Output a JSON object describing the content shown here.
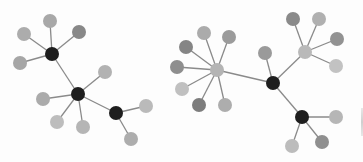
{
  "diagram": {
    "title": "",
    "type": "network-graph",
    "colors": {
      "background": "#fdfdfd",
      "edge": "#8a8a8a",
      "hub_dark": "#1e1e1e",
      "hub_light": "#b4b4b4",
      "leaf_light": "#b9b9b9",
      "leaf_mid": "#a2a2a2",
      "leaf_dark": "#838383"
    },
    "graphs": [
      {
        "id": "left-graph",
        "nodes": [
          {
            "id": "A",
            "role": "hub",
            "x": 52,
            "y": 54,
            "r": 7,
            "color": "#1e1e1e"
          },
          {
            "id": "A1",
            "role": "leaf",
            "x": 50,
            "y": 21,
            "r": 7,
            "color": "#a8a8a8"
          },
          {
            "id": "A2",
            "role": "leaf",
            "x": 24,
            "y": 34,
            "r": 7,
            "color": "#acacac"
          },
          {
            "id": "A3",
            "role": "leaf",
            "x": 79,
            "y": 32,
            "r": 7,
            "color": "#888888"
          },
          {
            "id": "A4",
            "role": "leaf",
            "x": 20,
            "y": 63,
            "r": 7,
            "color": "#a6a6a6"
          },
          {
            "id": "B",
            "role": "hub",
            "x": 78,
            "y": 94,
            "r": 7,
            "color": "#1e1e1e"
          },
          {
            "id": "B1",
            "role": "leaf",
            "x": 105,
            "y": 72,
            "r": 7,
            "color": "#b2b2b2"
          },
          {
            "id": "B2",
            "role": "leaf",
            "x": 43,
            "y": 99,
            "r": 7,
            "color": "#ababab"
          },
          {
            "id": "B3",
            "role": "leaf",
            "x": 57,
            "y": 122,
            "r": 7,
            "color": "#bdbdbd"
          },
          {
            "id": "B4",
            "role": "leaf",
            "x": 83,
            "y": 127,
            "r": 7,
            "color": "#b5b5b5"
          },
          {
            "id": "C",
            "role": "hub",
            "x": 116,
            "y": 113,
            "r": 7,
            "color": "#1e1e1e"
          },
          {
            "id": "C1",
            "role": "leaf",
            "x": 146,
            "y": 106,
            "r": 7,
            "color": "#bababa"
          },
          {
            "id": "C2",
            "role": "leaf",
            "x": 131,
            "y": 139,
            "r": 7,
            "color": "#adadad"
          }
        ],
        "edges": [
          [
            "A",
            "A1"
          ],
          [
            "A",
            "A2"
          ],
          [
            "A",
            "A3"
          ],
          [
            "A",
            "A4"
          ],
          [
            "A",
            "B"
          ],
          [
            "B",
            "B1"
          ],
          [
            "B",
            "B2"
          ],
          [
            "B",
            "B3"
          ],
          [
            "B",
            "B4"
          ],
          [
            "B",
            "C"
          ],
          [
            "C",
            "C1"
          ],
          [
            "C",
            "C2"
          ]
        ]
      },
      {
        "id": "right-graph",
        "nodes": [
          {
            "id": "D",
            "role": "hub",
            "x": 217,
            "y": 70,
            "r": 7,
            "color": "#b4b4b4"
          },
          {
            "id": "D1",
            "role": "leaf",
            "x": 204,
            "y": 33,
            "r": 7,
            "color": "#ababab"
          },
          {
            "id": "D2",
            "role": "leaf",
            "x": 229,
            "y": 37,
            "r": 7,
            "color": "#9b9b9b"
          },
          {
            "id": "D3",
            "role": "leaf",
            "x": 186,
            "y": 47,
            "r": 7,
            "color": "#858585"
          },
          {
            "id": "D4",
            "role": "leaf",
            "x": 177,
            "y": 67,
            "r": 7,
            "color": "#8e8e8e"
          },
          {
            "id": "D5",
            "role": "leaf",
            "x": 182,
            "y": 89,
            "r": 7,
            "color": "#c0c0c0"
          },
          {
            "id": "D6",
            "role": "leaf",
            "x": 199,
            "y": 105,
            "r": 7,
            "color": "#7d7d7d"
          },
          {
            "id": "D7",
            "role": "leaf",
            "x": 225,
            "y": 105,
            "r": 7,
            "color": "#adadad"
          },
          {
            "id": "E",
            "role": "hub",
            "x": 273,
            "y": 83,
            "r": 7,
            "color": "#1e1e1e"
          },
          {
            "id": "E1",
            "role": "leaf",
            "x": 265,
            "y": 53,
            "r": 7,
            "color": "#9a9a9a"
          },
          {
            "id": "F",
            "role": "hub",
            "x": 305,
            "y": 52,
            "r": 7,
            "color": "#b9b9b9"
          },
          {
            "id": "F1",
            "role": "leaf",
            "x": 293,
            "y": 19,
            "r": 7,
            "color": "#8a8a8a"
          },
          {
            "id": "F2",
            "role": "leaf",
            "x": 319,
            "y": 19,
            "r": 7,
            "color": "#b0b0b0"
          },
          {
            "id": "F3",
            "role": "leaf",
            "x": 337,
            "y": 39,
            "r": 7,
            "color": "#929292"
          },
          {
            "id": "F4",
            "role": "leaf",
            "x": 336,
            "y": 66,
            "r": 7,
            "color": "#c2c2c2"
          },
          {
            "id": "G",
            "role": "hub",
            "x": 302,
            "y": 117,
            "r": 7,
            "color": "#1e1e1e"
          },
          {
            "id": "G1",
            "role": "leaf",
            "x": 336,
            "y": 117,
            "r": 7,
            "color": "#b6b6b6"
          },
          {
            "id": "G2",
            "role": "leaf",
            "x": 322,
            "y": 142,
            "r": 7,
            "color": "#8f8f8f"
          },
          {
            "id": "G3",
            "role": "leaf",
            "x": 292,
            "y": 146,
            "r": 7,
            "color": "#bcbcbc"
          }
        ],
        "edges": [
          [
            "D",
            "D1"
          ],
          [
            "D",
            "D2"
          ],
          [
            "D",
            "D3"
          ],
          [
            "D",
            "D4"
          ],
          [
            "D",
            "D5"
          ],
          [
            "D",
            "D6"
          ],
          [
            "D",
            "D7"
          ],
          [
            "D",
            "E"
          ],
          [
            "E",
            "E1"
          ],
          [
            "E",
            "F"
          ],
          [
            "E",
            "G"
          ],
          [
            "F",
            "F1"
          ],
          [
            "F",
            "F2"
          ],
          [
            "F",
            "F3"
          ],
          [
            "F",
            "F4"
          ],
          [
            "G",
            "G1"
          ],
          [
            "G",
            "G2"
          ],
          [
            "G",
            "G3"
          ]
        ]
      }
    ]
  }
}
